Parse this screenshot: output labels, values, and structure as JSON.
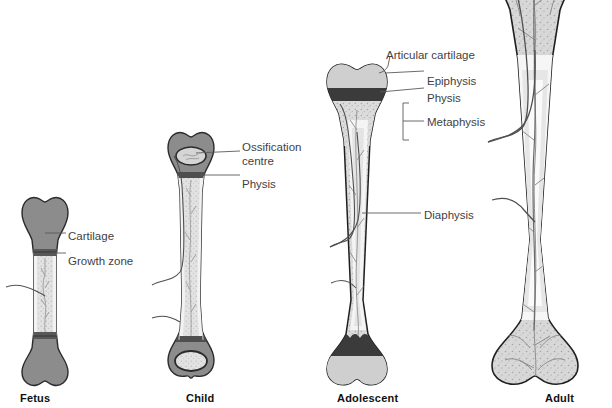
{
  "figure": {
    "width": 612,
    "height": 408
  },
  "colors": {
    "cartilage_gray": "#8c8c8c",
    "cartilage_outline": "#2b2b2b",
    "bone_light": "#d9d9d9",
    "bone_stipple": "#bfbfbf",
    "physis_dark": "#4a4a4a",
    "marrow_white": "#f4f4f4",
    "outline": "#1f1f1f",
    "vessel": "#555555",
    "leader_line": "#5a5a5a",
    "label_text": "#3f3f3f",
    "caption_text": "#111111",
    "background": "#ffffff"
  },
  "stages": [
    {
      "id": "fetus",
      "caption": "Fetus",
      "caption_x": 20,
      "caption_y": 392,
      "labels": [
        {
          "id": "cartilage",
          "text": "Cartilage",
          "x": 68,
          "y": 229
        },
        {
          "id": "growth-zone",
          "text": "Growth zone",
          "x": 68,
          "y": 254
        }
      ]
    },
    {
      "id": "child",
      "caption": "Child",
      "caption_x": 186,
      "caption_y": 392,
      "labels": [
        {
          "id": "ossification-centre-line1",
          "text": "Ossification",
          "x": 242,
          "y": 140
        },
        {
          "id": "ossification-centre-line2",
          "text": "centre",
          "x": 242,
          "y": 154
        },
        {
          "id": "physis",
          "text": "Physis",
          "x": 242,
          "y": 177
        }
      ]
    },
    {
      "id": "adolescent",
      "caption": "Adolescent",
      "caption_x": 337,
      "caption_y": 392,
      "labels": [
        {
          "id": "articular-cartilage",
          "text": "Articular cartilage",
          "x": 386,
          "y": 48
        },
        {
          "id": "epiphysis",
          "text": "Epiphysis",
          "x": 427,
          "y": 74
        },
        {
          "id": "physis",
          "text": "Physis",
          "x": 427,
          "y": 91
        },
        {
          "id": "metaphysis",
          "text": "Metaphysis",
          "x": 427,
          "y": 115
        },
        {
          "id": "diaphysis",
          "text": "Diaphysis",
          "x": 424,
          "y": 208
        }
      ]
    },
    {
      "id": "adult",
      "caption": "Adult",
      "caption_x": 545,
      "caption_y": 392,
      "labels": []
    }
  ]
}
